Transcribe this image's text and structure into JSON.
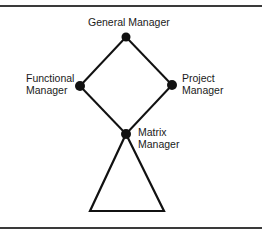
{
  "diagram": {
    "type": "matrix-organization-structure",
    "colors": {
      "line": "#111111",
      "node": "#111111",
      "text": "#1a1a1a",
      "rule": "#3a3a3a"
    },
    "nodes": [
      {
        "id": "general",
        "label_lines": [
          "General Manager"
        ],
        "x": 126,
        "y": 37
      },
      {
        "id": "functional",
        "label_lines": [
          "Functional",
          "Manager"
        ],
        "x": 80,
        "y": 86
      },
      {
        "id": "project",
        "label_lines": [
          "Project",
          "Manager"
        ],
        "x": 172,
        "y": 85
      },
      {
        "id": "matrix",
        "label_lines": [
          "Matrix",
          "Manager"
        ],
        "x": 126,
        "y": 134
      }
    ],
    "edges": [
      {
        "from": "general",
        "to": "functional"
      },
      {
        "from": "general",
        "to": "project"
      },
      {
        "from": "functional",
        "to": "matrix"
      },
      {
        "from": "project",
        "to": "matrix"
      }
    ],
    "subordinates_triangle": {
      "apex": [
        126,
        134
      ],
      "base_left": [
        90,
        211
      ],
      "base_right": [
        164,
        211
      ]
    }
  },
  "labels": {
    "general": {
      "line1": "General Manager"
    },
    "functional": {
      "line1": "Functional",
      "line2": "Manager"
    },
    "project": {
      "line1": "Project",
      "line2": "Manager"
    },
    "matrix": {
      "line1": "Matrix",
      "line2": "Manager"
    }
  }
}
